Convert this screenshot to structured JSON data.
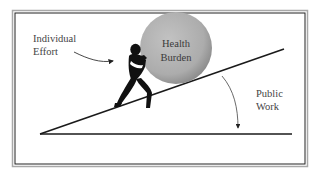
{
  "diagram": {
    "labels": {
      "individual_effort": [
        "Individual",
        "Effort"
      ],
      "health_burden": [
        "Health",
        "Burden"
      ],
      "public_work": [
        "Public",
        "Work"
      ]
    },
    "colors": {
      "ball_fill": "#b3b3b3",
      "ball_shade": "#8f8f8f",
      "line": "#1a1a1a",
      "frame_outer": "#9a9a9a",
      "frame_inner": "#222222",
      "text": "#444444"
    }
  }
}
